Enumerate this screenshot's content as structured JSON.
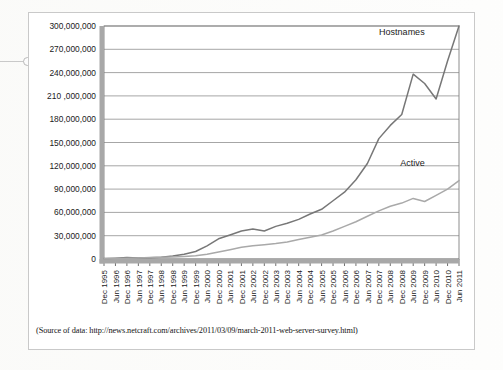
{
  "source_note": "(Source of data: http://news.netcraft.com/archives/2011/03/09/march-2011-web-server-survey.html)",
  "chart_data": {
    "type": "line",
    "title": "",
    "xlabel": "",
    "ylabel": "",
    "grid": true,
    "legend_position": "inline-annotation",
    "ylim": [
      0,
      300000000
    ],
    "yticks": [
      0,
      30000000,
      60000000,
      90000000,
      120000000,
      150000000,
      180000000,
      210000000,
      240000000,
      270000000,
      300000000
    ],
    "ytick_labels": [
      "0",
      "30,000,000",
      "60,000,000",
      "90,000,000",
      "120,000,000",
      "150,000,000",
      "180,000,000",
      "210 ,000,000",
      "240,000,000",
      "270,000,000",
      "300,000,000"
    ],
    "categories": [
      "Dec 1995",
      "Jun 1996",
      "Dec 1996",
      "Jun 1997",
      "Dec 1997",
      "Jun 1998",
      "Dec 1998",
      "Jun 1999",
      "Dec 1999",
      "Jun 2000",
      "Dec 2000",
      "Jun 2001",
      "Dec 2001",
      "Jun 2002",
      "Dec 2002",
      "Jun 2003",
      "Dec 2003",
      "Jun 2004",
      "Dec 2004",
      "Jun 2005",
      "Dec 2005",
      "Jun 2006",
      "Dec 2006",
      "Jun 2007",
      "Dec 2007",
      "Jun 2008",
      "Dec 2008",
      "Jun 2009",
      "Dec 2009",
      "Jun 2010",
      "Dec 2010",
      "Jun 2011"
    ],
    "series": [
      {
        "name": "Hostnames",
        "color": "#777777",
        "values": [
          500000,
          1000000,
          1800000,
          1200000,
          1700000,
          2400000,
          3800000,
          6200000,
          9600000,
          17000000,
          26000000,
          31000000,
          36000000,
          38500000,
          36000000,
          42000000,
          46000000,
          51000000,
          58000000,
          64000000,
          75000000,
          86000000,
          102000000,
          123000000,
          155000000,
          172000000,
          186000000,
          238000000,
          226000000,
          206000000,
          255000000,
          300000000
        ]
      },
      {
        "name": "Active",
        "color": "#a9a9a9",
        "values": [
          300000,
          600000,
          1000000,
          1400000,
          1800000,
          2200000,
          2700000,
          3300000,
          4200000,
          6000000,
          9000000,
          12000000,
          15000000,
          17000000,
          18500000,
          20000000,
          22000000,
          25000000,
          28000000,
          31000000,
          36000000,
          42000000,
          48000000,
          55000000,
          62000000,
          68000000,
          72000000,
          78000000,
          74000000,
          82000000,
          90000000,
          101000000
        ]
      }
    ],
    "annotations": [
      {
        "label": "Hostnames",
        "x_category": "Dec 2009",
        "y_value": 288000000
      },
      {
        "label": "Active",
        "x_category": "Dec 2009",
        "y_value": 120000000
      }
    ]
  }
}
